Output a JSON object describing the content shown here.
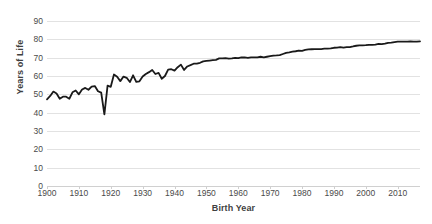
{
  "chart_data": {
    "type": "line",
    "title": "",
    "xlabel": "Birth Year",
    "ylabel": "Years of Life",
    "xlim": [
      1900,
      2017
    ],
    "ylim": [
      0,
      90
    ],
    "ytick_step": 10,
    "xtick_step": 10,
    "grid": true,
    "legend": false,
    "line_color": "#1a1a1a",
    "gridline_color": "#e2e2e2",
    "y_ticks": [
      0,
      10,
      20,
      30,
      40,
      50,
      60,
      70,
      80,
      90
    ],
    "x_ticks": [
      1900,
      1910,
      1920,
      1930,
      1940,
      1950,
      1960,
      1970,
      1980,
      1990,
      2000,
      2010
    ],
    "series": [
      {
        "name": "Life expectancy at birth",
        "x": [
          1900,
          1901,
          1902,
          1903,
          1904,
          1905,
          1906,
          1907,
          1908,
          1909,
          1910,
          1911,
          1912,
          1913,
          1914,
          1915,
          1916,
          1917,
          1918,
          1919,
          1920,
          1921,
          1922,
          1923,
          1924,
          1925,
          1926,
          1927,
          1928,
          1929,
          1930,
          1931,
          1932,
          1933,
          1934,
          1935,
          1936,
          1937,
          1938,
          1939,
          1940,
          1941,
          1942,
          1943,
          1944,
          1945,
          1946,
          1947,
          1948,
          1949,
          1950,
          1951,
          1952,
          1953,
          1954,
          1955,
          1956,
          1957,
          1958,
          1959,
          1960,
          1961,
          1962,
          1963,
          1964,
          1965,
          1966,
          1967,
          1968,
          1969,
          1970,
          1971,
          1972,
          1973,
          1974,
          1975,
          1976,
          1977,
          1978,
          1979,
          1980,
          1981,
          1982,
          1983,
          1984,
          1985,
          1986,
          1987,
          1988,
          1989,
          1990,
          1991,
          1992,
          1993,
          1994,
          1995,
          1996,
          1997,
          1998,
          1999,
          2000,
          2001,
          2002,
          2003,
          2004,
          2005,
          2006,
          2007,
          2008,
          2009,
          2010,
          2011,
          2012,
          2013,
          2014,
          2015,
          2016,
          2017
        ],
        "values": [
          47.3,
          49.1,
          51.5,
          50.5,
          47.6,
          48.7,
          48.7,
          47.6,
          51.1,
          52.1,
          50.0,
          52.6,
          53.5,
          52.5,
          54.2,
          54.5,
          51.7,
          50.9,
          39.1,
          54.7,
          54.1,
          60.8,
          59.6,
          57.2,
          59.7,
          59.0,
          56.7,
          60.4,
          56.8,
          57.1,
          59.7,
          61.1,
          62.1,
          63.3,
          61.1,
          61.7,
          58.5,
          60.0,
          63.5,
          63.7,
          62.9,
          64.8,
          66.2,
          63.3,
          65.2,
          65.9,
          66.7,
          66.8,
          67.2,
          68.0,
          68.2,
          68.4,
          68.6,
          68.8,
          69.6,
          69.6,
          69.7,
          69.5,
          69.6,
          69.9,
          69.7,
          70.2,
          70.1,
          69.9,
          70.2,
          70.2,
          70.2,
          70.5,
          70.2,
          70.5,
          70.8,
          71.1,
          71.2,
          71.4,
          72.0,
          72.6,
          72.9,
          73.3,
          73.5,
          73.9,
          73.7,
          74.2,
          74.5,
          74.6,
          74.7,
          74.7,
          74.7,
          74.9,
          74.9,
          75.1,
          75.4,
          75.5,
          75.8,
          75.5,
          75.7,
          75.8,
          76.1,
          76.5,
          76.7,
          76.7,
          76.8,
          77.0,
          77.0,
          77.1,
          77.5,
          77.4,
          77.7,
          78.1,
          78.2,
          78.5,
          78.7,
          78.7,
          78.8,
          78.8,
          78.9,
          78.7,
          78.7,
          78.9
        ]
      }
    ]
  },
  "axes": {
    "y_title": "Years of Life",
    "x_title": "Birth Year"
  }
}
